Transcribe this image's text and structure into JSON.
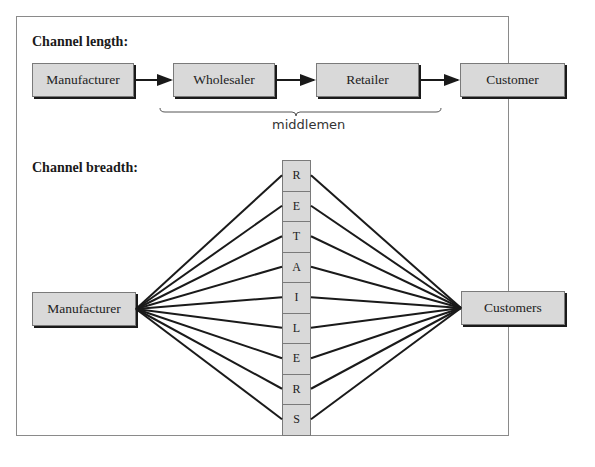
{
  "length_section": {
    "heading": "Channel length:",
    "nodes": [
      "Manufacturer",
      "Wholesaler",
      "Retailer",
      "Customer"
    ],
    "brace_label": "middlemen",
    "brace_spans": [
      "Wholesaler",
      "Retailer"
    ]
  },
  "breadth_section": {
    "heading": "Channel breadth:",
    "source": "Manufacturer",
    "target": "Customers",
    "retailer_letters": [
      "R",
      "E",
      "T",
      "A",
      "I",
      "L",
      "E",
      "R",
      "S"
    ]
  },
  "colors": {
    "box_fill": "#d9d9d9",
    "line": "#1a1a1a",
    "frame": "#8a8a8a"
  }
}
